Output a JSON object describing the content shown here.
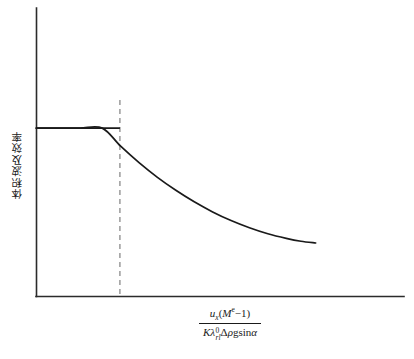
{
  "chart_data": {
    "type": "line",
    "title": "",
    "subtitle": "",
    "xlabel_parts": {
      "numerator": {
        "var": "u",
        "var_subscript": "x",
        "open_paren": "(",
        "base": "M",
        "exponent": "e",
        "minus_one": "−1",
        "close_paren": ")"
      },
      "denominator": {
        "k": "K",
        "lambda": "λ",
        "lambda_superscript": "0",
        "lambda_subscript": "rl",
        "delta": "Δ",
        "rho": "ρ",
        "g": "g",
        "sin": "sin",
        "alpha": "α"
      }
    },
    "xlabel_text": "u_x(M^e − 1) / (Kλ⁰_rl Δρg sinα)",
    "ylabel": "体积波及效率",
    "xlim": [
      0,
      1
    ],
    "ylim": [
      0,
      1
    ],
    "grid": false,
    "legend": false,
    "axis_ticks": [],
    "tick_labels": [],
    "series": [
      {
        "name": "体积波及效率",
        "style": "solid",
        "color": "#1a1a1a",
        "description": "plateau then exponential decay",
        "x": [
          0.0,
          0.06,
          0.12,
          0.18,
          0.23,
          0.28,
          0.33,
          0.38,
          0.43,
          0.48,
          0.53,
          0.58,
          0.63,
          0.68,
          0.72,
          0.76
        ],
        "y": [
          0.583,
          0.583,
          0.583,
          0.583,
          0.52,
          0.463,
          0.412,
          0.367,
          0.327,
          0.292,
          0.262,
          0.237,
          0.216,
          0.2,
          0.19,
          0.184
        ]
      }
    ],
    "annotations": [
      {
        "name": "breakpoint-dashed-line",
        "type": "vline",
        "x": 0.228,
        "style": "dashed",
        "color": "#9a9a9a",
        "label": ""
      },
      {
        "name": "plateau-segment",
        "type": "hline",
        "y": 0.583,
        "x_start": 0.0,
        "x_end": 0.228,
        "style": "solid",
        "color": "#1a1a1a",
        "label": ""
      }
    ]
  },
  "figure": {
    "background_color": "#ffffff",
    "axis_color": "#2b2b2b",
    "curve_color": "#1a1a1a",
    "dash_color": "#9a9a9a"
  }
}
